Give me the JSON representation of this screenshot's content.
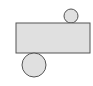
{
  "diagram": {
    "type": "cylinder-net",
    "colors": {
      "fill": "#e0e0e0",
      "stroke": "#555555",
      "background": "#ffffff"
    },
    "rectangle": {
      "x": 16,
      "y": 23,
      "width": 74,
      "height": 30
    },
    "top_circle": {
      "cx": 71,
      "cy": 16,
      "r": 7
    },
    "bottom_circle": {
      "cx": 34,
      "cy": 65,
      "r": 12
    }
  }
}
